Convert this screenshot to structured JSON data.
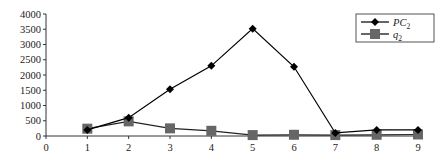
{
  "chart_data": {
    "type": "line",
    "title": "",
    "xlabel": "",
    "ylabel": "",
    "x": [
      1,
      2,
      3,
      4,
      5,
      6,
      7,
      8,
      9
    ],
    "xticks": [
      0,
      1,
      2,
      3,
      4,
      5,
      6,
      7,
      8,
      9
    ],
    "yticks": [
      0,
      500,
      1000,
      1500,
      2000,
      2500,
      3000,
      3500,
      4000
    ],
    "xlim": [
      0,
      9
    ],
    "ylim": [
      0,
      4000
    ],
    "grid": false,
    "legend_position": "upper right",
    "series": [
      {
        "name": "PC2",
        "label_main": "PC",
        "label_sub": "2",
        "marker": "diamond",
        "color": "#000000",
        "values": [
          200,
          600,
          1530,
          2300,
          3520,
          2270,
          100,
          200,
          200
        ]
      },
      {
        "name": "q2",
        "label_main": "q",
        "label_sub": "2",
        "marker": "square",
        "color": "#666666",
        "values": [
          240,
          480,
          250,
          170,
          30,
          40,
          30,
          40,
          50
        ]
      }
    ]
  }
}
